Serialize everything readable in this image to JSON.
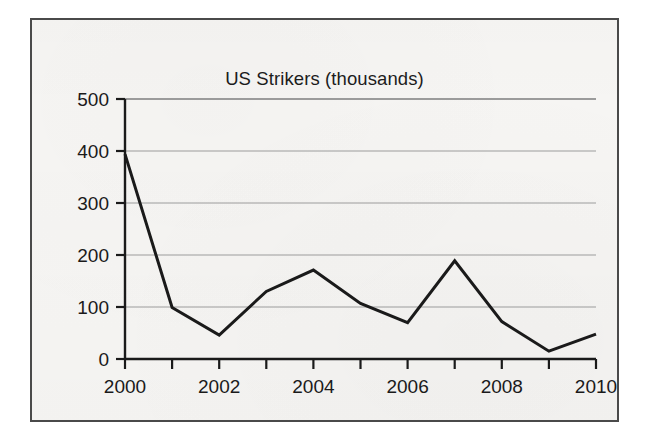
{
  "figure": {
    "border_color": "#4a4a4a",
    "background_color": "#f6f5f3"
  },
  "chart_data": {
    "type": "line",
    "title": "US Strikers (thousands)",
    "xlabel": "",
    "ylabel": "",
    "x": [
      2000,
      2001,
      2002,
      2003,
      2004,
      2005,
      2006,
      2007,
      2008,
      2009,
      2010
    ],
    "values": [
      394,
      99,
      46,
      130,
      171,
      107,
      70,
      189,
      72,
      15,
      48
    ],
    "series": [
      {
        "name": "US Strikers (thousands)",
        "values": [
          394,
          99,
          46,
          130,
          171,
          107,
          70,
          189,
          72,
          15,
          48
        ],
        "color": "#1a1a1a",
        "line_width": 3
      }
    ],
    "xlim": [
      2000,
      2010
    ],
    "ylim": [
      0,
      500
    ],
    "ytick_values": [
      0,
      100,
      200,
      300,
      400,
      500
    ],
    "ytick_labels": [
      "0",
      "100",
      "200",
      "300",
      "400",
      "500"
    ],
    "xtick_values": [
      2000,
      2001,
      2002,
      2003,
      2004,
      2005,
      2006,
      2007,
      2008,
      2009,
      2010
    ],
    "xtick_labels": [
      "2000",
      "",
      "2002",
      "",
      "2004",
      "",
      "2006",
      "",
      "2008",
      "",
      "2010"
    ],
    "xtick_labels_shown": [
      "2000",
      "2002",
      "2004",
      "2006",
      "2008",
      "2010"
    ],
    "grid": "horizontal",
    "grid_color": "#9b9b9b",
    "legend": "none",
    "markers": "none",
    "axis_color": "#1a1a1a"
  }
}
